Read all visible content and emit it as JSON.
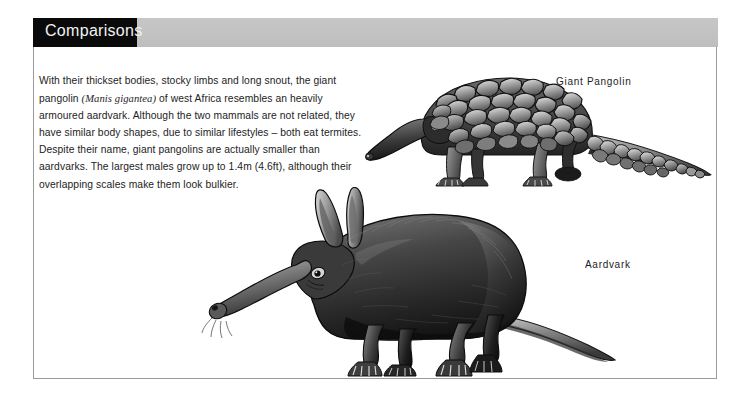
{
  "page": {
    "background_color": "#ffffff",
    "panel_border_color": "#9a9a9a"
  },
  "header": {
    "title": "Comparisons",
    "tab_color": "#0a0a0a",
    "tab_text_color": "#f2f2f2",
    "band_color": "#c2c2c2"
  },
  "body": {
    "text_before_sci": "With their thickset bodies, stocky limbs and long snout, the giant pangolin ",
    "scientific_name": "(Manis gigantea)",
    "text_after_sci": " of west Africa resembles an heavily armoured aardvark. Although the two mammals are not related, they have similar body shapes, due to similar lifestyles – both eat termites. Despite their name, giant pangolins are actually smaller than aardvarks. The largest males grow up to 1.4m (4.6ft), although their overlapping scales make them look bulkier.",
    "text_color": "#1d1d1d"
  },
  "figures": [
    {
      "id": "giant-pangolin",
      "label": "Giant Pangolin",
      "description": "Engraving of a giant pangolin in left profile with overlapping armoured scales and a long tapering scaled tail"
    },
    {
      "id": "aardvark",
      "label": "Aardvark",
      "description": "Engraving of an aardvark in left profile with long upright ears, elongated snout, arched back and tapering tail"
    }
  ]
}
